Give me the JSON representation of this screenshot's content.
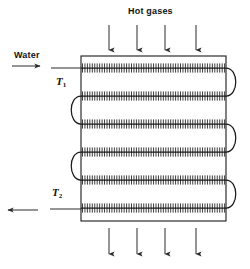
{
  "figure": {
    "type": "engineering-diagram",
    "labels": {
      "hot_gases": "Hot gases",
      "water": "Water",
      "t1": "T",
      "t1_sub": "1",
      "t2": "T",
      "t2_sub": "2"
    },
    "caption": "",
    "colors": {
      "line": "#1a1a1a",
      "background": "#ffffff",
      "arrow": "#2b2b2b"
    },
    "vessel": {
      "x": 81,
      "y": 56,
      "width": 145,
      "height": 165
    },
    "tube_rows": [
      {
        "index": 1,
        "y": 68,
        "bend_side": "right"
      },
      {
        "index": 2,
        "y": 96,
        "bend_side": "left"
      },
      {
        "index": 3,
        "y": 124,
        "bend_side": "right"
      },
      {
        "index": 4,
        "y": 152,
        "bend_side": "left"
      },
      {
        "index": 5,
        "y": 180,
        "bend_side": "right"
      },
      {
        "index": 6,
        "y": 208,
        "bend_side": "none"
      }
    ],
    "gas_arrows_top": [
      109,
      137,
      165,
      196
    ],
    "gas_arrows_bottom": [
      109,
      137,
      165,
      196
    ],
    "inlet": {
      "y": 68,
      "direction": "right"
    },
    "outlet": {
      "y": 208,
      "direction": "left"
    }
  }
}
